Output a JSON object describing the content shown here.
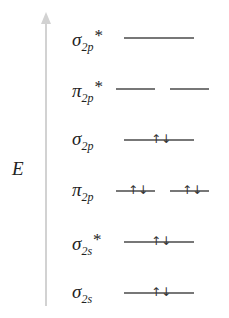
{
  "diagram": {
    "type": "molecular-orbital-energy-diagram",
    "axis_label": "E",
    "axis_direction": "up",
    "levels": [
      {
        "symbol": "σ",
        "subscript": "2p",
        "antibonding": true,
        "orbitals": 1,
        "electrons": [
          0
        ]
      },
      {
        "symbol": "π",
        "subscript": "2p",
        "antibonding": true,
        "orbitals": 2,
        "electrons": [
          0,
          0
        ]
      },
      {
        "symbol": "σ",
        "subscript": "2p",
        "antibonding": false,
        "orbitals": 1,
        "electrons": [
          2
        ]
      },
      {
        "symbol": "π",
        "subscript": "2p",
        "antibonding": false,
        "orbitals": 2,
        "electrons": [
          2,
          2
        ]
      },
      {
        "symbol": "σ",
        "subscript": "2s",
        "antibonding": true,
        "orbitals": 1,
        "electrons": [
          2
        ]
      },
      {
        "symbol": "σ",
        "subscript": "2s",
        "antibonding": false,
        "orbitals": 1,
        "electrons": [
          2
        ]
      }
    ],
    "star": "*",
    "spin_pair": "↑↓",
    "colors": {
      "axis": "#d2d2d2",
      "line": "#777777",
      "text": "#222222"
    }
  }
}
